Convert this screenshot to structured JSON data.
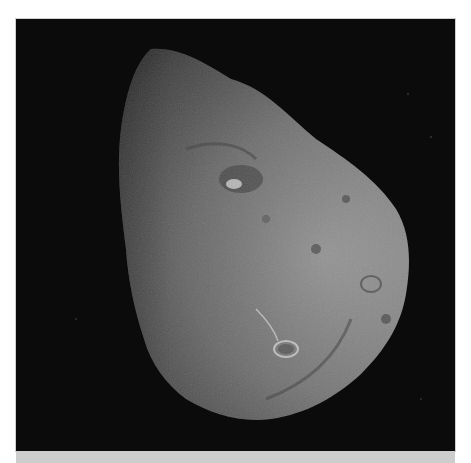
{
  "image": {
    "subject": "comet nucleus photograph",
    "alt": "Grayscale photograph of an irregular comet nucleus against a black background",
    "colors": {
      "background": "#0b0b0b",
      "surface_light": "#9a9a9a",
      "surface_mid": "#6e6e6e",
      "surface_dark": "#3a3a3a",
      "page": "#ffffff",
      "bottom_band": "#cdcdcd"
    }
  },
  "caption": ""
}
